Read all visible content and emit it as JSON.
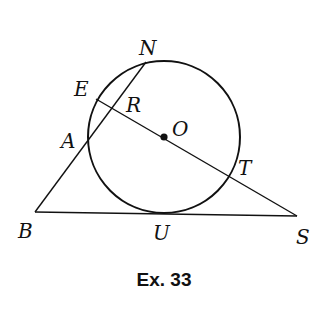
{
  "caption": "Ex. 33",
  "colors": {
    "stroke": "#111111",
    "background": "#ffffff"
  },
  "circle": {
    "center_label": "O",
    "cx": 164,
    "cy": 137,
    "r": 76
  },
  "points": {
    "N": {
      "label": "N",
      "x": 146,
      "y": 62
    },
    "E": {
      "label": "E",
      "x": 96,
      "y": 99
    },
    "R": {
      "label": "R",
      "x": 114,
      "y": 110
    },
    "O": {
      "label": "O",
      "x": 164,
      "y": 137
    },
    "A": {
      "label": "A",
      "x": 87,
      "y": 143
    },
    "T": {
      "label": "T",
      "x": 231,
      "y": 176
    },
    "B": {
      "label": "B",
      "x": 35,
      "y": 212
    },
    "U": {
      "label": "U",
      "x": 164,
      "y": 213
    },
    "S": {
      "label": "S",
      "x": 297,
      "y": 216
    }
  },
  "segments": [
    {
      "name": "segment-NB",
      "from": "N",
      "to": "B"
    },
    {
      "name": "segment-BS",
      "from": "B",
      "to": "S"
    },
    {
      "name": "segment-ES",
      "from": "E",
      "to": "S"
    }
  ]
}
